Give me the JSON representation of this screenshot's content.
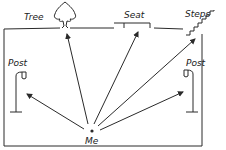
{
  "diagram": {
    "type": "hand-drawn scene with directional arrows",
    "stroke_color": "#2a2a2a",
    "background": "#ffffff",
    "observer": {
      "label": "Me",
      "x": 92,
      "y": 131
    },
    "landmarks": [
      {
        "id": "tree",
        "label": "Tree",
        "label_x": 12,
        "label_y": 20,
        "target_x": 65,
        "target_y": 33
      },
      {
        "id": "seat",
        "label": "Seat",
        "label_x": 126,
        "label_y": 15,
        "target_x": 138,
        "target_y": 31
      },
      {
        "id": "steps",
        "label": "Steps",
        "label_x": 186,
        "label_y": 15,
        "target_x": 197,
        "target_y": 38
      },
      {
        "id": "post-left",
        "label": "Post",
        "label_x": 8,
        "label_y": 64,
        "target_x": 25,
        "target_y": 93
      },
      {
        "id": "post-right",
        "label": "Post",
        "label_x": 190,
        "label_y": 64,
        "target_x": 185,
        "target_y": 91
      }
    ],
    "enclosure": {
      "x": 4,
      "y": 28,
      "width": 198,
      "height": 118
    }
  }
}
